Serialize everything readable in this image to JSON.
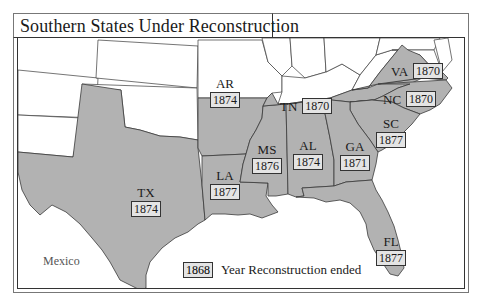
{
  "title": "Southern States Under Reconstruction",
  "colors": {
    "reconstruction_state_fill": "#b2b2b2",
    "other_state_fill": "#ffffff",
    "border": "#3a3a3a",
    "year_box_fill": "#e4e4e4"
  },
  "states": [
    {
      "abbr": "TX",
      "year": "1874"
    },
    {
      "abbr": "AR",
      "year": "1874"
    },
    {
      "abbr": "LA",
      "year": "1877"
    },
    {
      "abbr": "MS",
      "year": "1876"
    },
    {
      "abbr": "AL",
      "year": "1874"
    },
    {
      "abbr": "TN",
      "year": "1870"
    },
    {
      "abbr": "GA",
      "year": "1871"
    },
    {
      "abbr": "SC",
      "year": "1877"
    },
    {
      "abbr": "NC",
      "year": "1870"
    },
    {
      "abbr": "VA",
      "year": "1870"
    },
    {
      "abbr": "FL",
      "year": "1877"
    }
  ],
  "other_labels": {
    "mexico": "Mexico"
  },
  "legend": {
    "sample_year": "1868",
    "text": "Year Reconstruction ended"
  }
}
